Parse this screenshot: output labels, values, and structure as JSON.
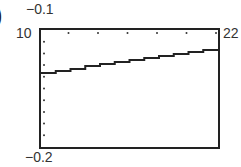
{
  "figure": {
    "part_marker": ")"
  },
  "chart_data": {
    "type": "line",
    "title": "",
    "xlabel": "",
    "ylabel": "",
    "xlim": [
      10,
      22
    ],
    "ylim": [
      -0.2,
      -0.1
    ],
    "window_labels": {
      "xmin": "10",
      "xmax": "22",
      "ymin": "−0.2",
      "ymax": "−0.1"
    },
    "grid": false,
    "tick_marks": "dots along top and left edges",
    "series": [
      {
        "name": "curve",
        "x": [
          10,
          12,
          14,
          16,
          18,
          20,
          22
        ],
        "values": [
          -0.137,
          -0.133,
          -0.129,
          -0.126,
          -0.122,
          -0.119,
          -0.116
        ]
      }
    ]
  }
}
